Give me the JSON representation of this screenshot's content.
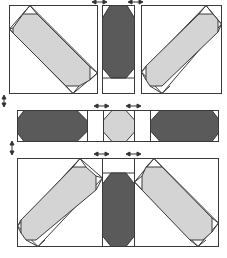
{
  "diagram": {
    "caption": "",
    "colors": {
      "stroke": "#3a3a3a",
      "background": "#ffffff",
      "light_fill": "#d4d4d4",
      "dark_fill": "#5a5a5a",
      "arrow": "#333333"
    },
    "rows": [
      {
        "name": "top-row",
        "units": [
          {
            "name": "diagonal-unit-top-left",
            "fill": "light",
            "orientation": "down-right"
          },
          {
            "name": "sashing-strip-top",
            "fill": "dark",
            "orientation": "vertical",
            "spacer": "bottom"
          },
          {
            "name": "diagonal-unit-top-right",
            "fill": "light",
            "orientation": "up-right"
          }
        ],
        "press_arrows": [
          "left-right",
          "left-right"
        ]
      },
      {
        "name": "middle-row",
        "units": [
          {
            "name": "sashing-strip-left",
            "fill": "dark",
            "orientation": "horizontal"
          },
          {
            "name": "spacer-left",
            "fill": "none"
          },
          {
            "name": "center-square",
            "fill": "light",
            "orientation": "octagon"
          },
          {
            "name": "spacer-right",
            "fill": "none"
          },
          {
            "name": "sashing-strip-right",
            "fill": "dark",
            "orientation": "horizontal"
          }
        ],
        "press_arrows": [
          "left-right",
          "left-right"
        ]
      },
      {
        "name": "bottom-row",
        "units": [
          {
            "name": "diagonal-unit-bottom-left",
            "fill": "light",
            "orientation": "up-right"
          },
          {
            "name": "sashing-strip-bottom",
            "fill": "dark",
            "orientation": "vertical",
            "spacer": "top"
          },
          {
            "name": "diagonal-unit-bottom-right",
            "fill": "light",
            "orientation": "down-right"
          }
        ],
        "press_arrows": [
          "left-right",
          "left-right"
        ]
      }
    ],
    "side_arrows": [
      "up-down",
      "up-down"
    ]
  }
}
